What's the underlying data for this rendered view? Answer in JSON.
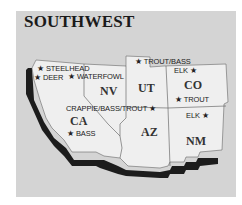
{
  "title": "SOUTHWEST",
  "colors": {
    "panel": "#d4d4d4",
    "land": "#efefef",
    "shadow": "#1c1c1c",
    "border": "#555555"
  },
  "states": [
    {
      "abbr": "CA"
    },
    {
      "abbr": "NV"
    },
    {
      "abbr": "UT"
    },
    {
      "abbr": "CO"
    },
    {
      "abbr": "AZ"
    },
    {
      "abbr": "NM"
    }
  ],
  "markers": [
    {
      "label": "STEELHEAD",
      "icon": "star-icon"
    },
    {
      "label": "DEER",
      "icon": "star-icon"
    },
    {
      "label": "WATERFOWL",
      "icon": "star-icon"
    },
    {
      "label": "TROUT/BASS",
      "icon": "star-icon"
    },
    {
      "label": "ELK",
      "icon": "star-icon"
    },
    {
      "label": "TROUT",
      "icon": "star-icon"
    },
    {
      "label": "CRAPPIE/BASS/TROUT",
      "icon": "star-icon"
    },
    {
      "label": "ELK",
      "icon": "star-icon"
    },
    {
      "label": "BASS",
      "icon": "star-icon"
    }
  ],
  "star": "★"
}
